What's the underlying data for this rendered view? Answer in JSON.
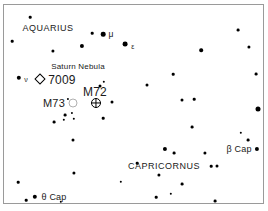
{
  "chart_data": {
    "type": "scatter",
    "title": "",
    "subtitle": "",
    "xlabel": "",
    "ylabel": "",
    "grid": false,
    "legend": "none",
    "xlim": [
      0,
      261
    ],
    "ylim": [
      0,
      200
    ],
    "series": [
      {
        "name": "stars",
        "symbol": "filled-circle",
        "color": "#000000",
        "points": [
          {
            "x": 26,
            "y": 12,
            "mag_size": 2.6
          },
          {
            "x": 8,
            "y": 36,
            "mag_size": 2.6
          },
          {
            "x": 88,
            "y": 28,
            "mag_size": 2.6
          },
          {
            "x": 99,
            "y": 29,
            "mag_size": 4.6
          },
          {
            "x": 78,
            "y": 41,
            "mag_size": 4.2
          },
          {
            "x": 121,
            "y": 39,
            "mag_size": 4.8
          },
          {
            "x": 49,
            "y": 46,
            "mag_size": 3.2
          },
          {
            "x": 234,
            "y": 25,
            "mag_size": 2.8
          },
          {
            "x": 245,
            "y": 42,
            "mag_size": 3.2
          },
          {
            "x": 197,
            "y": 45,
            "mag_size": 3.6
          },
          {
            "x": 15,
            "y": 73,
            "mag_size": 4.4
          },
          {
            "x": 100,
            "y": 77,
            "mag_size": 2.4
          },
          {
            "x": 96,
            "y": 81,
            "mag_size": 3.0
          },
          {
            "x": 252,
            "y": 69,
            "mag_size": 2.8
          },
          {
            "x": 169,
            "y": 69,
            "mag_size": 2.6
          },
          {
            "x": 143,
            "y": 80,
            "mag_size": 3.0
          },
          {
            "x": 108,
            "y": 97,
            "mag_size": 3.0
          },
          {
            "x": 178,
            "y": 95,
            "mag_size": 3.0
          },
          {
            "x": 190,
            "y": 94,
            "mag_size": 2.6
          },
          {
            "x": 254,
            "y": 104,
            "mag_size": 5.0
          },
          {
            "x": 64,
            "y": 94,
            "mag_size": 2.2
          },
          {
            "x": 61,
            "y": 110,
            "mag_size": 2.8
          },
          {
            "x": 68,
            "y": 108,
            "mag_size": 2.2
          },
          {
            "x": 50,
            "y": 117,
            "mag_size": 2.8
          },
          {
            "x": 60,
            "y": 115,
            "mag_size": 2.4
          },
          {
            "x": 70,
            "y": 114,
            "mag_size": 2.4
          },
          {
            "x": 99,
            "y": 113,
            "mag_size": 2.6
          },
          {
            "x": 188,
            "y": 122,
            "mag_size": 2.8
          },
          {
            "x": 237,
            "y": 128,
            "mag_size": 2.4
          },
          {
            "x": 244,
            "y": 135,
            "mag_size": 2.8
          },
          {
            "x": 69,
            "y": 135,
            "mag_size": 3.0
          },
          {
            "x": 161,
            "y": 144,
            "mag_size": 4.2
          },
          {
            "x": 170,
            "y": 148,
            "mag_size": 2.8
          },
          {
            "x": 201,
            "y": 148,
            "mag_size": 3.2
          },
          {
            "x": 253,
            "y": 144,
            "mag_size": 4.2
          },
          {
            "x": 207,
            "y": 161,
            "mag_size": 2.6
          },
          {
            "x": 213,
            "y": 161,
            "mag_size": 3.0
          },
          {
            "x": 133,
            "y": 158,
            "mag_size": 2.6
          },
          {
            "x": 155,
            "y": 170,
            "mag_size": 3.2
          },
          {
            "x": 70,
            "y": 168,
            "mag_size": 3.2
          },
          {
            "x": 117,
            "y": 177,
            "mag_size": 2.4
          },
          {
            "x": 178,
            "y": 179,
            "mag_size": 2.8
          },
          {
            "x": 14,
            "y": 177,
            "mag_size": 2.6
          },
          {
            "x": 31,
            "y": 192,
            "mag_size": 4.4
          },
          {
            "x": 22,
            "y": 195,
            "mag_size": 2.6
          },
          {
            "x": 57,
            "y": 197,
            "mag_size": 2.4
          },
          {
            "x": 152,
            "y": 192,
            "mag_size": 2.6
          },
          {
            "x": 167,
            "y": 189,
            "mag_size": 2.4
          },
          {
            "x": 211,
            "y": 196,
            "mag_size": 2.8
          }
        ]
      }
    ],
    "deep_sky_objects": [
      {
        "id": "ngc7009",
        "label": "7009",
        "caption": "Saturn Nebula",
        "marker": "open-diamond",
        "type": "planetary-nebula",
        "x": 36,
        "y": 74
      },
      {
        "id": "m73",
        "label": "M73",
        "marker": "open-circle",
        "type": "open-cluster",
        "x": 69,
        "y": 98
      },
      {
        "id": "m72",
        "label": "M72",
        "marker": "circle-cross",
        "type": "globular-cluster",
        "x": 92,
        "y": 98
      }
    ],
    "labels": [
      {
        "id": "aquarius",
        "text": "AQUARIUS",
        "kind": "constellation",
        "x": 44,
        "y": 23
      },
      {
        "id": "capricornus",
        "text": "CAPRICORNUS",
        "kind": "constellation",
        "x": 160,
        "y": 161
      },
      {
        "id": "mu-aqr",
        "text": "μ",
        "kind": "greek",
        "x": 107,
        "y": 29
      },
      {
        "id": "epsilon-aqr",
        "text": "ε",
        "kind": "greek-small",
        "x": 129,
        "y": 41
      },
      {
        "id": "nu-aqr",
        "text": "ν",
        "kind": "greek-small",
        "x": 22,
        "y": 74
      },
      {
        "id": "beta-cap",
        "text": "β Cap",
        "kind": "star-name",
        "x": 235,
        "y": 144
      },
      {
        "id": "theta-cap",
        "text": "θ Cap",
        "kind": "star-name",
        "x": 50,
        "y": 192
      },
      {
        "id": "saturn-nebula",
        "text": "Saturn Nebula",
        "kind": "caption",
        "x": 74,
        "y": 62
      },
      {
        "id": "ngc7009-label",
        "text": "7009",
        "kind": "deepsky",
        "x": 58,
        "y": 75
      },
      {
        "id": "m72-label",
        "text": "M72",
        "kind": "deepsky",
        "x": 91,
        "y": 87
      },
      {
        "id": "m73-label",
        "text": "M73",
        "kind": "deepsky-sm",
        "x": 50,
        "y": 98
      }
    ],
    "colors": {
      "background": "#ffffff",
      "star": "#000000",
      "text": "#1a1a1a",
      "frame": "#9a9a9a",
      "open_cluster_outline": "#b0b0b0"
    }
  }
}
